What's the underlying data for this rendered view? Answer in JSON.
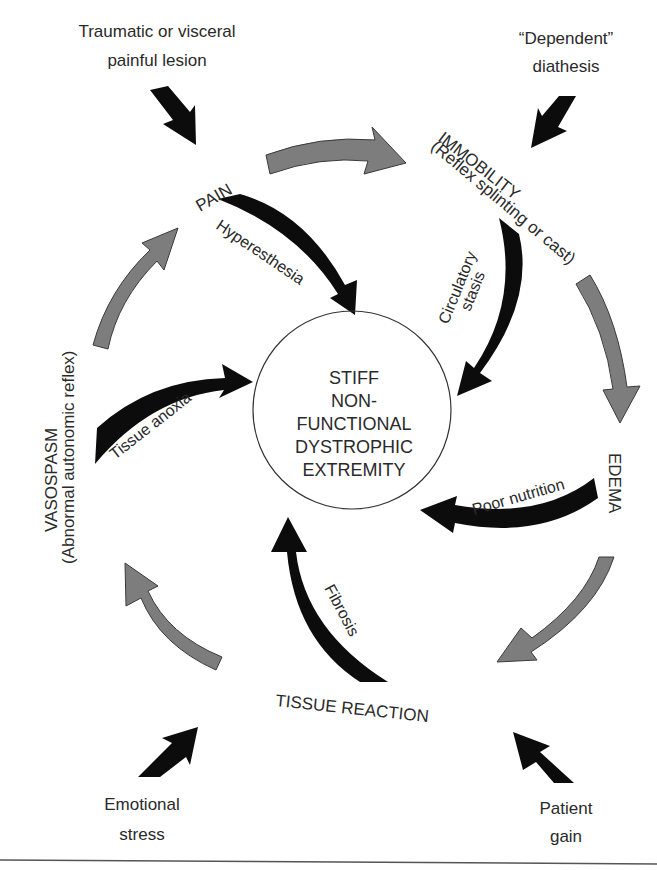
{
  "diagram": {
    "center": {
      "lines": [
        "STIFF",
        "NON-",
        "FUNCTIONAL",
        "DYSTROPHIC",
        "EXTREMITY"
      ]
    },
    "nodes": {
      "pain": "PAIN",
      "immobility": "IMMOBILITY",
      "immobility_sub": "(Reflex splinting or cast)",
      "edema": "EDEMA",
      "tissue_reaction": "TISSUE REACTION",
      "vasospasm": "VASOSPASM",
      "vasospasm_sub": "(Abnormal autonomic reflex)"
    },
    "inward_edges": {
      "hyperesthesia": "Hyperesthesia",
      "circulatory_1": "Circulatory",
      "circulatory_2": "stasis",
      "poor_nutrition": "Poor nutrition",
      "fibrosis": "Fibrosis",
      "tissue_anoxia": "Tissue anoxia"
    },
    "external_inputs": {
      "traumatic_1": "Traumatic or visceral",
      "traumatic_2": "painful lesion",
      "dependent_1": "“Dependent”",
      "dependent_2": "diathesis",
      "emotional_1": "Emotional",
      "emotional_2": "stress",
      "patient_1": "Patient",
      "patient_2": "gain"
    },
    "colors": {
      "cycle_arrow": "#7d7d7d",
      "inward_arrow": "#0c0c0c",
      "text": "#2a2a2a",
      "circle_stroke": "#333333"
    }
  }
}
